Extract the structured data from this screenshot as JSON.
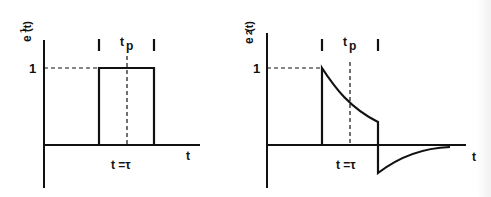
{
  "panels": [
    {
      "id": "left",
      "y_label_main": "e",
      "y_label_sub": "1",
      "y_label_arg": "(t)",
      "level_label": "1",
      "pulse_width_label": "t",
      "pulse_width_sub": "p",
      "time_label": "t =τ",
      "x_label": "t",
      "waveform": "rectangular pulse"
    },
    {
      "id": "right",
      "y_label_main": "e",
      "y_label_sub": "2",
      "y_label_arg": "(t)",
      "level_label": "1",
      "pulse_width_label": "t",
      "pulse_width_sub": "p",
      "time_label": "t =τ",
      "x_label": "t",
      "waveform": "exponential decay with negative undershoot"
    }
  ]
}
